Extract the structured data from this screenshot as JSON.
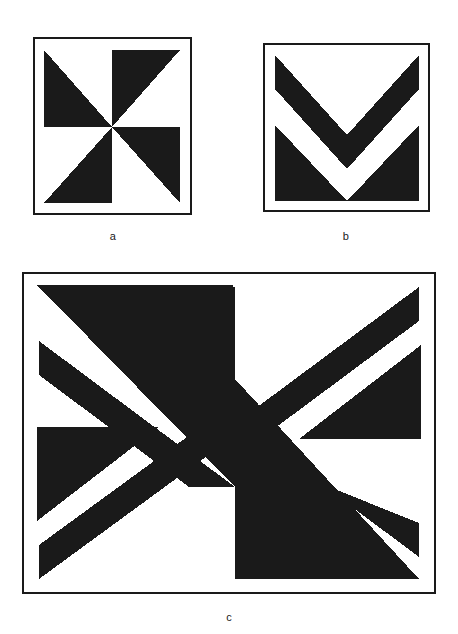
{
  "figure": {
    "background_color": "#ffffff",
    "ink_color": "#1a1a1a",
    "fill_color": "#1a1a1a",
    "panel_count": 3
  },
  "panels": [
    {
      "id": "a",
      "caption": "a",
      "shape_name": "pinwheel",
      "description": "Square frame containing a four-fold pinwheel of solid black right triangles meeting at the centre.",
      "frame": {
        "x": 33,
        "y": 37,
        "width": 159,
        "height": 178,
        "border_width": 2.5
      }
    },
    {
      "id": "b",
      "caption": "b",
      "shape_name": "double-chevron",
      "description": "Square frame containing two nested downward-pointing black chevrons, a narrow upper band and a thick lower wedge.",
      "frame": {
        "x": 263,
        "y": 43,
        "width": 167,
        "height": 169,
        "border_width": 2.5
      }
    },
    {
      "id": "c",
      "caption": "c",
      "shape_name": "pinwheel-with-chevron-bands",
      "description": "Large rectangular frame combining the pinwheel of (a) with the separated diagonal chevron bands of (b) in each quadrant.",
      "frame": {
        "x": 22,
        "y": 272,
        "width": 414,
        "height": 322,
        "border_width": 2.5
      }
    }
  ],
  "chart_data": {
    "type": "diagram",
    "title": "",
    "panels": [
      {
        "label": "a",
        "viewbox": [
          0,
          0,
          148,
          167
        ],
        "polygons": [
          {
            "name": "quadrant-top-left-triangle",
            "points": "6,8 74,8 74,84 6,84"
          },
          {
            "name": "quadrant-top-right-triangle",
            "points": "74,8 142,8 74,84"
          },
          {
            "name": "quadrant-bottom-right-triangle",
            "points": "74,84 142,84 142,160 74,84"
          },
          {
            "name": "quadrant-bottom-left-triangle",
            "points": "74,84 74,160 6,160"
          }
        ]
      },
      {
        "label": "b",
        "viewbox": [
          0,
          0,
          156,
          158
        ],
        "polygons": [
          {
            "name": "chevron-upper-band",
            "points": "6,6 78,86 150,6 150,40 78,120 6,40"
          },
          {
            "name": "chevron-lower-wedge",
            "points": "6,76 78,152 150,76 150,152 6,152"
          }
        ]
      },
      {
        "label": "c",
        "viewbox": [
          0,
          0,
          400,
          308
        ],
        "polygons": [
          {
            "name": "tl-main-triangle",
            "points": "10,8 206,8 206,208 10,8"
          },
          {
            "name": "tl-band",
            "points": "10,62 10,96 160,208 206,208"
          },
          {
            "name": "tr-band",
            "points": "390,8 390,42 242,152 196,152"
          },
          {
            "name": "tr-triangle",
            "points": "390,66 390,208 242,208"
          },
          {
            "name": "bl-triangle",
            "points": "10,158 150,158 10,268 10,158"
          },
          {
            "name": "bl-band",
            "points": "10,300 10,266 158,158 204,158"
          },
          {
            "name": "br-main-triangle",
            "points": "206,100 206,300 390,300 206,100"
          },
          {
            "name": "br-band",
            "points": "390,244 390,278 240,166 196,166"
          }
        ]
      }
    ]
  },
  "captions": {
    "a": "a",
    "b": "b",
    "c": "c"
  }
}
